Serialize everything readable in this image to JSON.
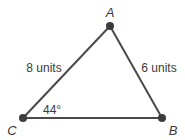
{
  "figure": {
    "type": "triangle",
    "vertices": {
      "A": {
        "label": "A"
      },
      "B": {
        "label": "B"
      },
      "C": {
        "label": "C"
      }
    },
    "sides": {
      "CA": {
        "label": "8 units",
        "length": 8
      },
      "AB": {
        "label": "6 units",
        "length": 6
      },
      "CB": {
        "label": "",
        "length": null
      }
    },
    "angles": {
      "C": {
        "label": "44°",
        "degrees": 44
      }
    },
    "drawn_to_scale": false,
    "colors": {
      "line": "#4a4a4a",
      "point": "#3c3c3c",
      "text": "#3a3a3a",
      "background": "#ffffff"
    }
  }
}
